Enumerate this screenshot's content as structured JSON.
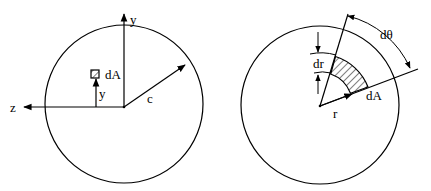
{
  "figure": {
    "left": {
      "title": "Circular cross-section, Cartesian element",
      "labels": {
        "y_axis": "y",
        "z_axis": "z",
        "element": "dA",
        "element_distance": "y",
        "radius": "c"
      }
    },
    "right": {
      "title": "Circular cross-section, polar element",
      "labels": {
        "angle": "dθ",
        "thickness": "dr",
        "element": "dA",
        "radius": "r"
      }
    }
  }
}
